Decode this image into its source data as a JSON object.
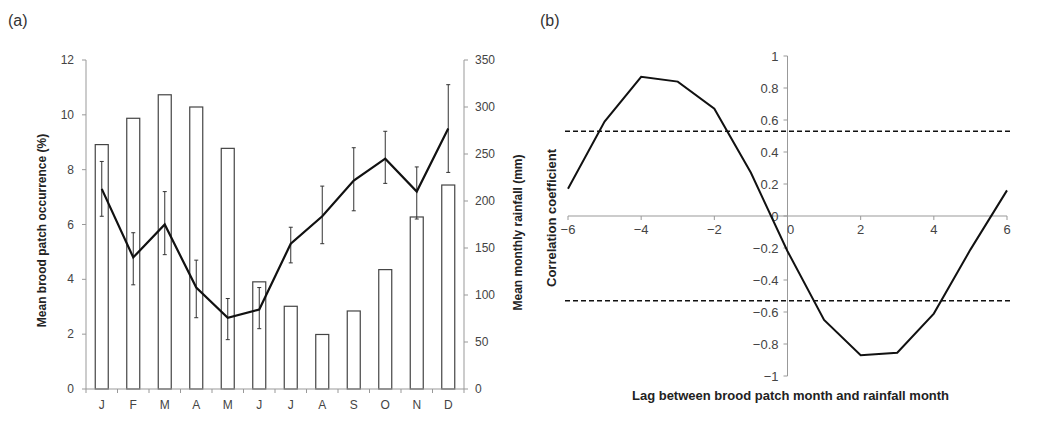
{
  "chart_data": [
    {
      "panel_label": "(a)",
      "type": "bar+line",
      "title": "",
      "categories": [
        "J",
        "F",
        "M",
        "A",
        "M",
        "J",
        "J",
        "A",
        "S",
        "O",
        "N",
        "D"
      ],
      "xlabel": "",
      "ylabel_left": "Mean brood patch occurrence (%)",
      "ylabel_right": "Mean monthly rainfall (mm)",
      "ylim_left": [
        0,
        12
      ],
      "ylim_right": [
        0,
        350
      ],
      "yticks_left": [
        0,
        2,
        4,
        6,
        8,
        10,
        12
      ],
      "yticks_right": [
        0,
        50,
        100,
        150,
        200,
        250,
        300,
        350
      ],
      "grid": false,
      "series": [
        {
          "name": "Mean monthly rainfall (mm)",
          "type": "bar",
          "axis": "right",
          "values": [
            260,
            288,
            313,
            300,
            256,
            114,
            88,
            58,
            83,
            127,
            183,
            217
          ]
        },
        {
          "name": "Mean brood patch occurrence (%)",
          "type": "line",
          "axis": "left",
          "values": [
            7.3,
            4.8,
            6.0,
            3.7,
            2.6,
            2.9,
            5.3,
            6.3,
            7.6,
            8.4,
            7.2,
            9.5
          ],
          "error_low": [
            6.3,
            3.8,
            4.9,
            2.6,
            1.8,
            2.2,
            4.6,
            5.3,
            6.5,
            7.5,
            6.2,
            7.9
          ],
          "error_high": [
            8.3,
            5.7,
            7.2,
            4.7,
            3.3,
            3.7,
            5.9,
            7.4,
            8.8,
            9.4,
            8.1,
            11.1
          ]
        }
      ]
    },
    {
      "panel_label": "(b)",
      "type": "line",
      "title": "",
      "x": [
        -6,
        -5,
        -4,
        -3,
        -2,
        -1,
        0,
        1,
        2,
        3,
        4,
        5,
        6
      ],
      "xlabel": "Lag between brood patch month and rainfall month",
      "ylabel": "Correlation coefficient",
      "xlim": [
        -6,
        6
      ],
      "ylim": [
        -1,
        1
      ],
      "xticks": [
        -6,
        -4,
        -2,
        0,
        2,
        4,
        6
      ],
      "yticks": [
        -1,
        -0.8,
        -0.6,
        -0.4,
        -0.2,
        0,
        0.2,
        0.4,
        0.6,
        0.8,
        1
      ],
      "grid": false,
      "series": [
        {
          "name": "Correlation coefficient",
          "values": [
            0.17,
            0.59,
            0.87,
            0.84,
            0.67,
            0.27,
            -0.22,
            -0.65,
            -0.87,
            -0.855,
            -0.61,
            -0.21,
            0.16
          ]
        }
      ],
      "reference_lines": [
        {
          "y": 0.53,
          "style": "dashed"
        },
        {
          "y": -0.53,
          "style": "dashed"
        }
      ]
    }
  ]
}
